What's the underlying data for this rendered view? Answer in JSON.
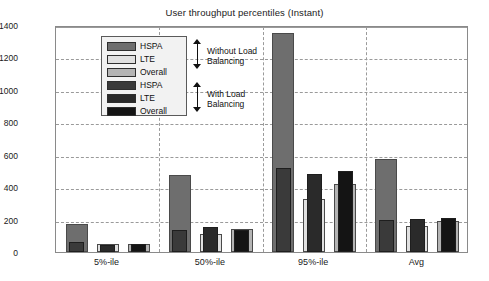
{
  "chart_data": {
    "type": "bar",
    "title": "User throughput percentiles (Instant)",
    "xlabel": "",
    "ylabel": "UE throughput [kbps]",
    "categories": [
      "5%-ile",
      "50%-ile",
      "95%-ile",
      "Avg"
    ],
    "ylim": [
      0,
      1400
    ],
    "yticks": [
      0,
      200,
      400,
      600,
      800,
      1000,
      1200,
      1400
    ],
    "grid": true,
    "legend_position": "upper-left-inside",
    "series": [
      {
        "name": "HSPA",
        "group": "Without Load Balancing",
        "color": "#6e6e6e",
        "values": [
          170,
          475,
          1350,
          575
        ]
      },
      {
        "name": "LTE",
        "group": "Without Load Balancing",
        "color": "#e0e0e0",
        "values": [
          50,
          110,
          330,
          160
        ]
      },
      {
        "name": "Overall",
        "group": "Without Load Balancing",
        "color": "#b4b4b4",
        "values": [
          52,
          145,
          420,
          190
        ]
      },
      {
        "name": "HSPA",
        "group": "With Load Balancing",
        "color": "#3a3a3a",
        "values": [
          62,
          135,
          520,
          200
        ]
      },
      {
        "name": "LTE",
        "group": "With Load Balancing",
        "color": "#2a2a2a",
        "values": [
          45,
          155,
          480,
          205
        ]
      },
      {
        "name": "Overall",
        "group": "With Load Balancing",
        "color": "#141414",
        "values": [
          48,
          135,
          500,
          210
        ]
      }
    ],
    "annotations": [
      {
        "text": "Without Load\nBalancing",
        "line1": "Without Load",
        "line2": "Balancing"
      },
      {
        "text": "With Load\nBalancing",
        "line1": "With Load",
        "line2": "Balancing"
      }
    ]
  },
  "legend": {
    "items": [
      {
        "label": "HSPA",
        "color": "#6e6e6e"
      },
      {
        "label": "LTE",
        "color": "#e0e0e0"
      },
      {
        "label": "Overall",
        "color": "#b4b4b4"
      },
      {
        "label": "HSPA",
        "color": "#3a3a3a"
      },
      {
        "label": "LTE",
        "color": "#2a2a2a"
      },
      {
        "label": "Overall",
        "color": "#141414"
      }
    ]
  },
  "annotations": {
    "without_lb_line1": "Without Load",
    "without_lb_line2": "Balancing",
    "with_lb_line1": "With Load",
    "with_lb_line2": "Balancing"
  }
}
